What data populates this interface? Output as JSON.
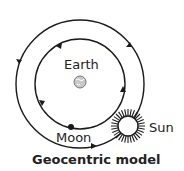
{
  "diagram": {
    "title": "Geocentric model",
    "labels": {
      "earth": "Earth",
      "moon": "Moon",
      "sun": "Sun"
    },
    "colors": {
      "line": "#1a1a1a",
      "earth_fill": "#c8c8c8",
      "background": "#ffffff"
    }
  }
}
